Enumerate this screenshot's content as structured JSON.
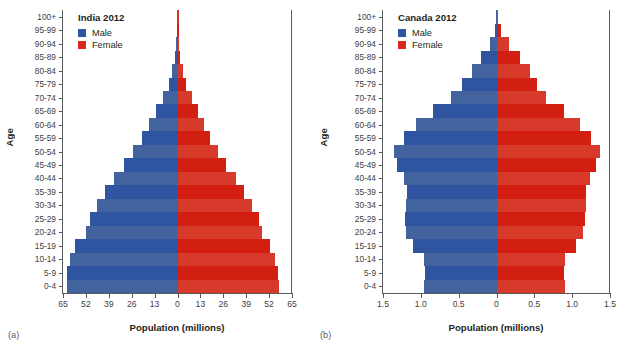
{
  "figure": {
    "axis_y_title": "Age",
    "axis_x_title": "Population (millions)",
    "legend_male": "Male",
    "legend_female": "Female",
    "color_male": "#2f54a0",
    "color_female": "#d42a1e"
  },
  "panels": [
    {
      "caption": "(a)",
      "title": "India 2012",
      "xlabel": "Population (millions)",
      "ylabel": "Age"
    },
    {
      "caption": "(b)",
      "title": "Canada 2012",
      "xlabel": "Population (millions)",
      "ylabel": "Age"
    }
  ],
  "chart_data": [
    {
      "type": "bar",
      "subtype": "population-pyramid",
      "panel": "a",
      "title": "India 2012",
      "xlabel": "Population (millions)",
      "ylabel": "Age",
      "xlim": [
        -65,
        65
      ],
      "xticks": [
        65,
        52,
        39,
        26,
        13,
        0,
        13,
        26,
        39,
        52,
        65
      ],
      "xtick_labels": [
        "65",
        "52",
        "39",
        "26",
        "13",
        "0",
        "13",
        "26",
        "39",
        "52",
        "65"
      ],
      "grid": false,
      "legend_position": "top-left",
      "categories": [
        "0-4",
        "5-9",
        "10-14",
        "15-19",
        "20-24",
        "25-29",
        "30-34",
        "35-39",
        "40-44",
        "45-49",
        "50-54",
        "55-59",
        "60-64",
        "65-69",
        "70-74",
        "75-79",
        "80-84",
        "85-89",
        "90-94",
        "95-99",
        "100+"
      ],
      "series": [
        {
          "name": "Male",
          "color": "#2f54a0",
          "units": "millions",
          "values": [
            63.0,
            62.5,
            61.0,
            58.0,
            52.0,
            49.5,
            45.5,
            41.0,
            36.0,
            30.5,
            25.0,
            20.0,
            16.0,
            12.0,
            8.5,
            5.0,
            3.0,
            1.4,
            0.6,
            0.2,
            0.25
          ]
        },
        {
          "name": "Female",
          "color": "#d42a1e",
          "units": "millions",
          "values": [
            57.5,
            57.0,
            55.5,
            52.5,
            48.0,
            46.0,
            42.5,
            38.0,
            33.0,
            27.5,
            23.0,
            18.5,
            15.0,
            11.5,
            8.0,
            5.0,
            3.0,
            1.5,
            0.7,
            0.3,
            0.6
          ]
        }
      ]
    },
    {
      "type": "bar",
      "subtype": "population-pyramid",
      "panel": "b",
      "title": "Canada 2012",
      "xlabel": "Population (millions)",
      "ylabel": "Age",
      "xlim": [
        -1.5,
        1.5
      ],
      "xticks": [
        1.5,
        1.0,
        0.5,
        0,
        0.5,
        1.0,
        1.5
      ],
      "xtick_labels": [
        "1.5",
        "1.0",
        "0.5",
        "0",
        "0.5",
        "1.0",
        "1.5"
      ],
      "grid": false,
      "legend_position": "top-left",
      "categories": [
        "0-4",
        "5-9",
        "10-14",
        "15-19",
        "20-24",
        "25-29",
        "30-34",
        "35-39",
        "40-44",
        "45-49",
        "50-54",
        "55-59",
        "60-64",
        "65-69",
        "70-74",
        "75-79",
        "80-84",
        "85-89",
        "90-94",
        "95-99",
        "100+"
      ],
      "series": [
        {
          "name": "Male",
          "color": "#2f54a0",
          "units": "millions",
          "values": [
            0.96,
            0.94,
            0.96,
            1.11,
            1.2,
            1.21,
            1.19,
            1.18,
            1.22,
            1.32,
            1.36,
            1.22,
            1.06,
            0.84,
            0.6,
            0.45,
            0.33,
            0.2,
            0.09,
            0.02,
            0.004
          ]
        },
        {
          "name": "Female",
          "color": "#d42a1e",
          "units": "millions",
          "values": [
            0.91,
            0.89,
            0.91,
            1.05,
            1.14,
            1.17,
            1.18,
            1.18,
            1.23,
            1.32,
            1.37,
            1.25,
            1.1,
            0.89,
            0.66,
            0.53,
            0.44,
            0.31,
            0.17,
            0.06,
            0.012
          ]
        }
      ]
    }
  ]
}
